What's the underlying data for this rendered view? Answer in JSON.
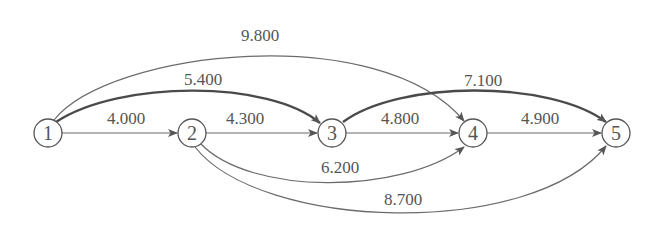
{
  "diagram": {
    "type": "directed-network",
    "nodes": [
      {
        "id": "1",
        "label": "1",
        "x": 48,
        "y": 133
      },
      {
        "id": "2",
        "label": "2",
        "x": 192,
        "y": 133
      },
      {
        "id": "3",
        "label": "3",
        "x": 332,
        "y": 133
      },
      {
        "id": "4",
        "label": "4",
        "x": 473,
        "y": 133
      },
      {
        "id": "5",
        "label": "5",
        "x": 616,
        "y": 133
      }
    ],
    "edges": [
      {
        "from": "1",
        "to": "2",
        "weight": "4.000",
        "highlighted": false
      },
      {
        "from": "2",
        "to": "3",
        "weight": "4.300",
        "highlighted": false
      },
      {
        "from": "3",
        "to": "4",
        "weight": "4.800",
        "highlighted": false
      },
      {
        "from": "4",
        "to": "5",
        "weight": "4.900",
        "highlighted": false
      },
      {
        "from": "1",
        "to": "3",
        "weight": "5.400",
        "highlighted": true
      },
      {
        "from": "3",
        "to": "5",
        "weight": "7.100",
        "highlighted": true
      },
      {
        "from": "1",
        "to": "4",
        "weight": "9.800",
        "highlighted": false
      },
      {
        "from": "2",
        "to": "4",
        "weight": "6.200",
        "highlighted": false
      },
      {
        "from": "2",
        "to": "5",
        "weight": "8.700",
        "highlighted": false
      }
    ]
  }
}
